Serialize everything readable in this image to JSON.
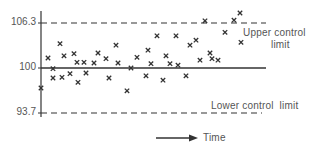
{
  "chart_data": {
    "type": "scatter",
    "title": "",
    "xlabel": "Time",
    "ylabel": "",
    "ylim": [
      92.9,
      108.2
    ],
    "grid": false,
    "legend": null,
    "y_ticks": [
      {
        "value": 106.3,
        "label": "106.3"
      },
      {
        "value": 100,
        "label": "100"
      },
      {
        "value": 93.7,
        "label": "93.7"
      }
    ],
    "reference_lines": [
      {
        "name": "Upper control limit",
        "value": 106.3,
        "style": "dashed"
      },
      {
        "name": "Centre line",
        "value": 100,
        "style": "solid"
      },
      {
        "name": "Lower control limit",
        "value": 93.7,
        "style": "dashed"
      }
    ],
    "annotations": {
      "upper_line1": "Upper control",
      "upper_line2": "limit",
      "lower": "Lower control  limit",
      "time_arrow": "Time"
    },
    "marker": "x",
    "points": [
      {
        "t": 41,
        "y": 97.2
      },
      {
        "t": 48,
        "y": 101.4
      },
      {
        "t": 53,
        "y": 99.9
      },
      {
        "t": 53,
        "y": 98.6
      },
      {
        "t": 60,
        "y": 103.4
      },
      {
        "t": 62,
        "y": 98.7
      },
      {
        "t": 64,
        "y": 101.7
      },
      {
        "t": 70,
        "y": 99.2
      },
      {
        "t": 74,
        "y": 102.0
      },
      {
        "t": 77,
        "y": 100.8
      },
      {
        "t": 78,
        "y": 98.0
      },
      {
        "t": 84,
        "y": 100.8
      },
      {
        "t": 86,
        "y": 99.3
      },
      {
        "t": 94,
        "y": 100.7
      },
      {
        "t": 98,
        "y": 102.1
      },
      {
        "t": 106,
        "y": 101.3
      },
      {
        "t": 109,
        "y": 98.6
      },
      {
        "t": 116,
        "y": 103.2
      },
      {
        "t": 118,
        "y": 100.7
      },
      {
        "t": 127,
        "y": 96.8
      },
      {
        "t": 131,
        "y": 100.0
      },
      {
        "t": 137,
        "y": 101.5
      },
      {
        "t": 146,
        "y": 98.9
      },
      {
        "t": 148,
        "y": 102.5
      },
      {
        "t": 151,
        "y": 100.6
      },
      {
        "t": 157,
        "y": 104.5
      },
      {
        "t": 163,
        "y": 98.3
      },
      {
        "t": 166,
        "y": 101.7
      },
      {
        "t": 170,
        "y": 100.6
      },
      {
        "t": 176,
        "y": 104.5
      },
      {
        "t": 178,
        "y": 100.4
      },
      {
        "t": 186,
        "y": 98.9
      },
      {
        "t": 190,
        "y": 103.2
      },
      {
        "t": 196,
        "y": 103.9
      },
      {
        "t": 200,
        "y": 101.1
      },
      {
        "t": 205,
        "y": 106.6
      },
      {
        "t": 210,
        "y": 102.1
      },
      {
        "t": 212,
        "y": 101.3
      },
      {
        "t": 218,
        "y": 101.1
      },
      {
        "t": 225,
        "y": 105.0
      },
      {
        "t": 234,
        "y": 106.7
      },
      {
        "t": 240,
        "y": 107.7
      },
      {
        "t": 241,
        "y": 103.6
      }
    ]
  },
  "colors": {
    "ink": "#333333",
    "label": "#555555",
    "background": "#ffffff"
  }
}
